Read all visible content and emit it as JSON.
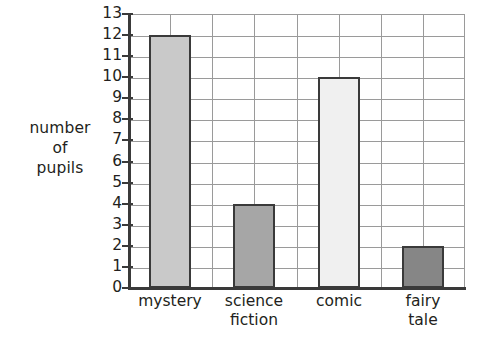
{
  "chart_data": {
    "type": "bar",
    "title": "",
    "xlabel": "",
    "ylabel": "number of pupils",
    "ylabel_lines": [
      "number",
      "of",
      "pupils"
    ],
    "categories": [
      "mystery",
      "science fiction",
      "comic",
      "fairy tale"
    ],
    "category_label_lines": [
      [
        "mystery"
      ],
      [
        "science",
        "fiction"
      ],
      [
        "comic"
      ],
      [
        "fairy",
        "tale"
      ]
    ],
    "values": [
      12,
      4,
      10,
      2
    ],
    "ylim": [
      0,
      13
    ],
    "ytick_step": 1,
    "ytick_labels": [
      "0",
      "1",
      "2",
      "3",
      "4",
      "5",
      "6",
      "7",
      "8",
      "9",
      "10",
      "11",
      "12",
      "13"
    ],
    "grid": true,
    "legend": "none",
    "bar_colors": [
      "#c9c9c9",
      "#a6a6a6",
      "#f0f0f0",
      "#868686"
    ],
    "bar_outline_color": "#3a3a3a",
    "grid_color": "#9a9a9a",
    "axis_color": "#3a3a3a",
    "background_color": "#ffffff"
  }
}
